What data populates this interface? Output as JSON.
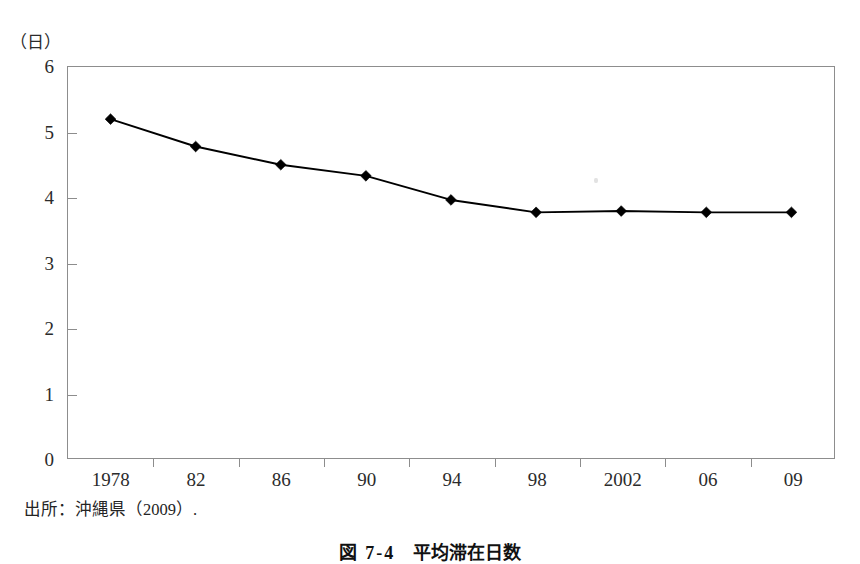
{
  "figure": {
    "unit_label": "（日）",
    "source_note": "出所：沖縄県（2009）.",
    "caption_number": "図 7-4",
    "caption_title": "平均滞在日数"
  },
  "chart_data": {
    "type": "line",
    "title": "平均滞在日数",
    "xlabel": "",
    "ylabel": "（日）",
    "unit": "日",
    "categories": [
      "1978",
      "82",
      "86",
      "90",
      "94",
      "98",
      "2002",
      "06",
      "09"
    ],
    "values": [
      5.2,
      4.78,
      4.5,
      4.33,
      3.96,
      3.77,
      3.79,
      3.77,
      3.77
    ],
    "series": [
      {
        "name": "平均滞在日数",
        "values": [
          5.2,
          4.78,
          4.5,
          4.33,
          3.96,
          3.77,
          3.79,
          3.77,
          3.77
        ],
        "color": "#000000",
        "marker": "diamond"
      }
    ],
    "ylim": [
      0,
      6
    ],
    "yticks": [
      0,
      1,
      2,
      3,
      4,
      5,
      6
    ],
    "ytick_labels": [
      "0",
      "1",
      "2",
      "3",
      "4",
      "5",
      "6"
    ],
    "grid": false,
    "legend": false,
    "legend_position": "none",
    "frame": true
  }
}
